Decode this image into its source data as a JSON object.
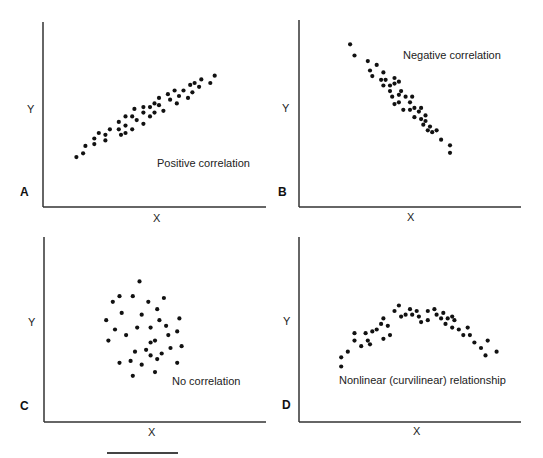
{
  "figure": {
    "scale_bar": true
  },
  "chart_data": [
    {
      "id": "A",
      "type": "scatter",
      "panel_letter": "A",
      "annotation": "Positive correlation",
      "xlabel": "X",
      "ylabel": "Y",
      "xlim": [
        0,
        100
      ],
      "ylim": [
        0,
        100
      ],
      "grid": false,
      "points": [
        [
          15,
          27
        ],
        [
          18,
          29
        ],
        [
          19,
          33
        ],
        [
          23,
          34
        ],
        [
          23,
          37
        ],
        [
          25,
          40
        ],
        [
          28,
          36
        ],
        [
          28,
          39
        ],
        [
          30,
          42
        ],
        [
          34,
          42
        ],
        [
          34,
          46
        ],
        [
          35,
          39
        ],
        [
          37,
          49
        ],
        [
          37,
          44
        ],
        [
          37,
          40
        ],
        [
          40,
          42
        ],
        [
          40,
          49
        ],
        [
          41,
          53
        ],
        [
          42,
          47
        ],
        [
          45,
          45
        ],
        [
          45,
          54
        ],
        [
          45,
          51
        ],
        [
          48,
          49
        ],
        [
          48,
          54
        ],
        [
          50,
          56
        ],
        [
          50,
          51
        ],
        [
          52,
          59
        ],
        [
          52,
          55
        ],
        [
          54,
          52
        ],
        [
          56,
          61
        ],
        [
          57,
          58
        ],
        [
          59,
          63
        ],
        [
          60,
          56
        ],
        [
          61,
          60
        ],
        [
          63,
          63
        ],
        [
          65,
          59
        ],
        [
          66,
          66
        ],
        [
          67,
          62
        ],
        [
          68,
          67
        ],
        [
          70,
          65
        ],
        [
          71,
          69
        ],
        [
          75,
          67
        ],
        [
          77,
          71
        ]
      ]
    },
    {
      "id": "B",
      "type": "scatter",
      "panel_letter": "B",
      "annotation": "Negative correlation",
      "xlabel": "X",
      "ylabel": "Y",
      "xlim": [
        0,
        100
      ],
      "ylim": [
        0,
        100
      ],
      "grid": false,
      "points": [
        [
          23,
          87
        ],
        [
          25,
          81
        ],
        [
          31,
          78
        ],
        [
          32,
          73
        ],
        [
          33,
          70
        ],
        [
          35,
          76
        ],
        [
          38,
          72
        ],
        [
          37,
          68
        ],
        [
          39,
          68
        ],
        [
          38,
          65
        ],
        [
          41,
          65
        ],
        [
          43,
          69
        ],
        [
          43,
          66
        ],
        [
          45,
          67
        ],
        [
          41,
          62
        ],
        [
          42,
          59
        ],
        [
          45,
          60
        ],
        [
          43,
          55
        ],
        [
          45,
          56
        ],
        [
          46,
          62
        ],
        [
          48,
          59
        ],
        [
          50,
          56
        ],
        [
          51,
          59
        ],
        [
          47,
          52
        ],
        [
          50,
          52
        ],
        [
          52,
          53
        ],
        [
          52,
          48
        ],
        [
          54,
          51
        ],
        [
          55,
          53
        ],
        [
          55,
          47
        ],
        [
          57,
          49
        ],
        [
          56,
          44
        ],
        [
          57,
          46
        ],
        [
          59,
          43
        ],
        [
          58,
          41
        ],
        [
          60,
          40
        ],
        [
          62,
          41
        ],
        [
          64,
          36
        ],
        [
          68,
          33
        ],
        [
          68,
          29
        ]
      ]
    },
    {
      "id": "C",
      "type": "scatter",
      "panel_letter": "C",
      "annotation": "No correlation",
      "xlabel": "X",
      "ylabel": "Y",
      "xlim": [
        0,
        100
      ],
      "ylim": [
        0,
        100
      ],
      "grid": false,
      "points": [
        [
          43,
          76
        ],
        [
          34,
          68
        ],
        [
          40,
          68
        ],
        [
          31,
          65
        ],
        [
          47,
          65
        ],
        [
          51,
          61
        ],
        [
          54,
          67
        ],
        [
          44,
          58
        ],
        [
          35,
          59
        ],
        [
          28,
          55
        ],
        [
          52,
          55
        ],
        [
          61,
          56
        ],
        [
          42,
          51
        ],
        [
          48,
          51
        ],
        [
          55,
          52
        ],
        [
          56,
          47
        ],
        [
          60,
          49
        ],
        [
          37,
          47
        ],
        [
          50,
          44
        ],
        [
          29,
          44
        ],
        [
          57,
          40
        ],
        [
          46,
          39
        ],
        [
          41,
          38
        ],
        [
          48,
          36
        ],
        [
          53,
          37
        ],
        [
          62,
          41
        ],
        [
          39,
          33
        ],
        [
          34,
          32
        ],
        [
          44,
          31
        ],
        [
          51,
          34
        ],
        [
          60,
          32
        ],
        [
          50,
          27
        ],
        [
          40,
          25
        ],
        [
          48,
          43
        ],
        [
          32,
          50
        ]
      ]
    },
    {
      "id": "D",
      "type": "scatter",
      "panel_letter": "D",
      "annotation": "Nonlinear (curvilinear) relationship",
      "xlabel": "X",
      "ylabel": "Y",
      "xlim": [
        0,
        100
      ],
      "ylim": [
        0,
        100
      ],
      "grid": false,
      "points": [
        [
          19,
          35
        ],
        [
          19,
          30
        ],
        [
          22,
          38
        ],
        [
          25,
          44
        ],
        [
          25,
          48
        ],
        [
          28,
          41
        ],
        [
          30,
          48
        ],
        [
          31,
          44
        ],
        [
          32,
          42
        ],
        [
          33,
          49
        ],
        [
          35,
          50
        ],
        [
          37,
          53
        ],
        [
          38,
          56
        ],
        [
          38,
          45
        ],
        [
          40,
          52
        ],
        [
          41,
          47
        ],
        [
          43,
          60
        ],
        [
          45,
          63
        ],
        [
          46,
          57
        ],
        [
          48,
          58
        ],
        [
          50,
          61
        ],
        [
          51,
          58
        ],
        [
          53,
          60
        ],
        [
          54,
          57
        ],
        [
          55,
          54
        ],
        [
          58,
          60
        ],
        [
          58,
          55
        ],
        [
          61,
          61
        ],
        [
          62,
          58
        ],
        [
          64,
          56
        ],
        [
          65,
          59
        ],
        [
          66,
          53
        ],
        [
          67,
          56
        ],
        [
          69,
          57
        ],
        [
          69,
          51
        ],
        [
          70,
          55
        ],
        [
          72,
          50
        ],
        [
          74,
          47
        ],
        [
          76,
          51
        ],
        [
          77,
          47
        ],
        [
          79,
          43
        ],
        [
          82,
          40
        ],
        [
          85,
          44
        ],
        [
          84,
          36
        ],
        [
          89,
          38
        ]
      ]
    }
  ]
}
